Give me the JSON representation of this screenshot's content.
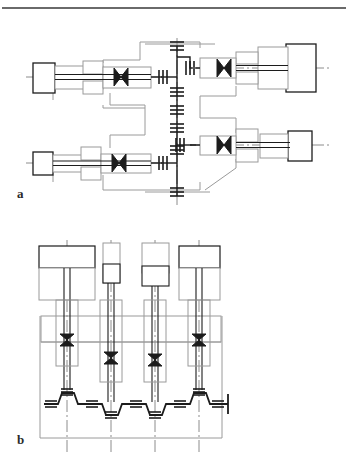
{
  "page": {
    "background_color": "#ffffff",
    "width": 348,
    "height": 460,
    "has_top_rule": true,
    "top_rule_color": "#6a6a6a"
  },
  "figure": {
    "caption_a": "a",
    "caption_b": "b",
    "line_color_light": "#9a9a9a",
    "line_color_dark": "#1c1c1c",
    "centerline_color": "#8c8c8c"
  },
  "diagram_a": {
    "name": "horizontal-multi-spindle-drive-layout",
    "orientation": "horizontal",
    "vertical_shaft": {
      "x": 177,
      "y_top": 38,
      "y_bottom": 203,
      "bearing_count": 6,
      "bearing_positions_y": [
        46,
        92,
        110,
        128,
        150,
        192
      ]
    },
    "spindle_units": [
      {
        "id": "unit-upper-left",
        "position": "upper-left",
        "axis_y": 77,
        "motor_block": {
          "x": 33,
          "y": 63,
          "w": 22,
          "h": 30
        },
        "body": {
          "x": 55,
          "y": 66,
          "w": 48,
          "h": 23
        },
        "bevel_gear_x": 121,
        "output_end_x": 155,
        "direction": "right"
      },
      {
        "id": "unit-upper-right",
        "position": "upper-right",
        "axis_y": 68,
        "motor_block": {
          "x": 286,
          "y": 44,
          "w": 30,
          "h": 48
        },
        "body": {
          "x": 244,
          "y": 50,
          "w": 44,
          "h": 36
        },
        "bevel_gear_x": 224,
        "output_end_x": 196,
        "direction": "left"
      },
      {
        "id": "unit-lower-left",
        "position": "lower-left",
        "axis_y": 163,
        "motor_block": {
          "x": 33,
          "y": 152,
          "w": 20,
          "h": 23
        },
        "body": {
          "x": 53,
          "y": 155,
          "w": 48,
          "h": 18
        },
        "bevel_gear_x": 119,
        "output_end_x": 157,
        "direction": "right"
      },
      {
        "id": "unit-lower-right",
        "position": "lower-right",
        "axis_y": 145,
        "motor_block": {
          "x": 288,
          "y": 131,
          "w": 24,
          "h": 30
        },
        "body": {
          "x": 248,
          "y": 135,
          "w": 42,
          "h": 24
        },
        "bevel_gear_x": 224,
        "output_end_x": 196,
        "direction": "left"
      }
    ],
    "bevel_gear_symbol": "bowtie-pair",
    "bevel_gear_count": 4
  },
  "diagram_b": {
    "name": "vertical-gang-spindle-head-layout",
    "orientation": "vertical",
    "spindle_count": 4,
    "column_centers_x": [
      67,
      111,
      155,
      199
    ],
    "motor_blocks": [
      {
        "id": "motor-1",
        "x": 39,
        "y": 246,
        "w": 56,
        "h": 22,
        "tall": false
      },
      {
        "id": "motor-2",
        "x": 103,
        "y": 243,
        "w": 17,
        "h": 40,
        "tall": true
      },
      {
        "id": "motor-3",
        "x": 142,
        "y": 243,
        "w": 27,
        "h": 30,
        "tall": true
      },
      {
        "id": "motor-4",
        "x": 179,
        "y": 246,
        "w": 41,
        "h": 22,
        "tall": false
      }
    ],
    "housing_band": {
      "x": 41,
      "y": 316,
      "w": 180,
      "h": 26
    },
    "frame": {
      "x": 40,
      "y": 316,
      "w": 182,
      "h": 122
    },
    "bevel_gears": [
      {
        "column": 1,
        "x": 67,
        "y": 340
      },
      {
        "column": 2,
        "x": 111,
        "y": 358
      },
      {
        "column": 3,
        "x": 155,
        "y": 360
      },
      {
        "column": 4,
        "x": 199,
        "y": 340
      }
    ],
    "drive_shaft": {
      "type": "zigzag-horizontal",
      "y_high": 393,
      "y_low": 404,
      "x_start": 44,
      "x_end": 228,
      "coupling_count": 8
    }
  },
  "annotations": {
    "symbols": [
      {
        "name": "bevel-gear-pair",
        "glyph": "bowtie",
        "meaning": "bevel gear pair"
      },
      {
        "name": "bearing",
        "glyph": "double-hatch",
        "meaning": "shaft bearing"
      },
      {
        "name": "coupling",
        "glyph": "hatched-block",
        "meaning": "shaft coupling"
      },
      {
        "name": "centerline",
        "glyph": "dash-dot",
        "meaning": "axis centerline"
      }
    ]
  }
}
